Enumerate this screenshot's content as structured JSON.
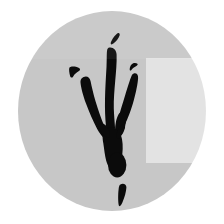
{
  "image": {
    "subject": "bird-footprint-track",
    "description": "Stylized black three-toed bird/theropod footprint silhouette centered on a light gray circle",
    "canvas": {
      "width": 224,
      "height": 224,
      "background_color": "#ffffff"
    }
  },
  "background": {
    "circle": {
      "name": "gray-circle-backdrop",
      "color": "#c7c7c7",
      "center_x": 112,
      "center_y": 111,
      "radius_x": 94,
      "radius_y": 100
    },
    "seam_band": {
      "name": "upper-seam-band",
      "color": "#ffffff",
      "opacity": 0.055,
      "top": 0,
      "height": 59
    },
    "panel_overlay": {
      "name": "right-panel-overlay",
      "color": "#ffffff",
      "opacity": 0.5,
      "left": 146,
      "top": 58,
      "width": 78,
      "height": 105
    }
  },
  "footprint": {
    "color": "#0b0b0b",
    "parts": [
      {
        "name": "middle-toe",
        "role": "central digit, longest, vertical"
      },
      {
        "name": "middle-toe-claw-tip",
        "role": "detached claw sliver above middle toe"
      },
      {
        "name": "left-toe",
        "role": "outer left digit angled down-right"
      },
      {
        "name": "left-toe-claw-tip",
        "role": "detached triangular claw above left toe"
      },
      {
        "name": "right-toe",
        "role": "outer right digit angled down-left"
      },
      {
        "name": "right-toe-claw-tip",
        "role": "small detached claw fleck above right toe"
      },
      {
        "name": "metatarsal-pad",
        "role": "heel pad where toes converge"
      },
      {
        "name": "heel-bulb",
        "role": "rounded detached heel impression below pad"
      },
      {
        "name": "tail-drag-mark",
        "role": "tapered streak at bottom"
      }
    ]
  }
}
